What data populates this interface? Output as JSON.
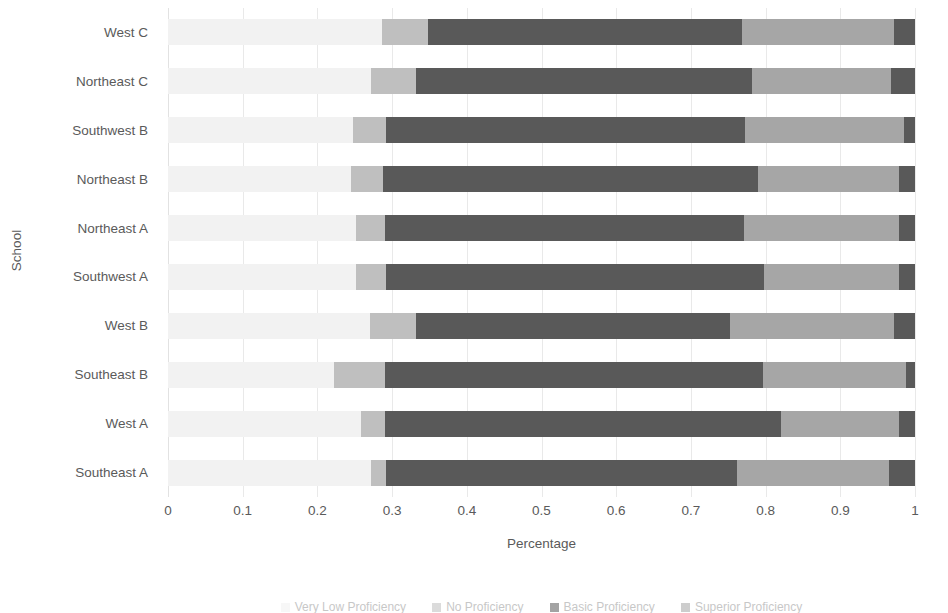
{
  "chart_data": {
    "type": "bar",
    "subtype": "stacked-horizontal-100percent",
    "title": "",
    "xlabel": "Percentage",
    "ylabel": "School",
    "xlim": [
      0,
      1
    ],
    "xticks": [
      "0",
      "0.1",
      "0.2",
      "0.3",
      "0.4",
      "0.5",
      "0.6",
      "0.7",
      "0.8",
      "0.9",
      "1"
    ],
    "xtick_values": [
      0,
      0.1,
      0.2,
      0.3,
      0.4,
      0.5,
      0.6,
      0.7,
      0.8,
      0.9,
      1
    ],
    "grid": true,
    "grid_axis": "x",
    "legend_position": "bottom",
    "legend": [
      "Very Low Proficiency",
      "No Proficiency",
      "Basic Proficiency",
      "Superior Proficiency"
    ],
    "series": [
      {
        "name": "Very Low Proficiency",
        "color": "#f2f2f2",
        "values": [
          0.29,
          0.26,
          0.22,
          0.25,
          0.25,
          0.24,
          0.25,
          0.28,
          0.24,
          0.28
        ]
      },
      {
        "name": "No Proficiency",
        "color": "#bfbfbf",
        "values": [
          0.03,
          0.06,
          0.07,
          0.04,
          0.03,
          0.05,
          0.08,
          0.05,
          0.09,
          0.06
        ]
      },
      {
        "name": "Basic Proficiency",
        "color": "#595959",
        "values": [
          0.44,
          0.48,
          0.52,
          0.51,
          0.49,
          0.48,
          0.42,
          0.44,
          0.48,
          0.42
        ]
      },
      {
        "name": "Superior Proficiency",
        "color": "#a6a6a6",
        "values": [
          0.21,
          0.19,
          0.18,
          0.19,
          0.22,
          0.22,
          0.24,
          0.22,
          0.18,
          0.23
        ]
      }
    ],
    "end_cap": {
      "name": "Superior Proficiency",
      "color": "#595959",
      "values": [
        0.03,
        0.01,
        0.01,
        0.01,
        0.01,
        0.01,
        0.01,
        0.01,
        0.01,
        0.01
      ]
    },
    "categories": [
      "West C",
      "Northeast C",
      "Southwest B",
      "Northeast B",
      "Northeast A",
      "Southwest A",
      "West B",
      "Southeast B",
      "West A",
      "Southeast A"
    ],
    "rows": [
      {
        "school": "West C",
        "stops": [
          0.286,
          0.348,
          0.769,
          0.972,
          1.0
        ]
      },
      {
        "school": "Northeast C",
        "stops": [
          0.272,
          0.332,
          0.782,
          0.968,
          1.0
        ]
      },
      {
        "school": "Southwest B",
        "stops": [
          0.248,
          0.292,
          0.773,
          0.985,
          1.0
        ]
      },
      {
        "school": "Northeast B",
        "stops": [
          0.245,
          0.288,
          0.79,
          0.978,
          1.0
        ]
      },
      {
        "school": "Northeast A",
        "stops": [
          0.252,
          0.29,
          0.771,
          0.978,
          1.0
        ]
      },
      {
        "school": "Southwest A",
        "stops": [
          0.252,
          0.292,
          0.798,
          0.978,
          1.0
        ]
      },
      {
        "school": "West B",
        "stops": [
          0.27,
          0.332,
          0.752,
          0.972,
          1.0
        ]
      },
      {
        "school": "Southeast B",
        "stops": [
          0.222,
          0.29,
          0.797,
          0.988,
          1.0
        ]
      },
      {
        "school": "West A",
        "stops": [
          0.258,
          0.29,
          0.82,
          0.978,
          1.0
        ]
      },
      {
        "school": "Southeast A",
        "stops": [
          0.272,
          0.292,
          0.762,
          0.965,
          1.0
        ]
      }
    ],
    "colors": {
      "segment_1": "#f2f2f2",
      "segment_2": "#bfbfbf",
      "segment_3": "#595959",
      "segment_4": "#a6a6a6",
      "segment_5": "#595959",
      "gridline": "#e9e9e9",
      "text": "#5a5a5a",
      "background": "#ffffff"
    }
  }
}
